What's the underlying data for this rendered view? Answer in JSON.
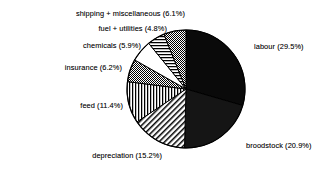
{
  "chart_data": {
    "type": "pie",
    "title": "",
    "subtitle": "",
    "xlabel": "",
    "ylabel": "",
    "legend_position": "none",
    "grid": false,
    "labels_show_percent": true,
    "start_angle_deg": 0,
    "direction": "clockwise",
    "categories": [
      "labour",
      "broodstock",
      "depreciation",
      "feed",
      "insurance",
      "chemicals",
      "fuel + utilities",
      "shipping + miscellaneous"
    ],
    "values": [
      29.5,
      20.9,
      15.2,
      11.4,
      6.2,
      5.9,
      4.8,
      6.1
    ],
    "units": "percent",
    "total": 100.0,
    "slices": [
      {
        "name": "labour",
        "value": 29.5,
        "label": "labour (29.5%)",
        "fill": "solid-black",
        "color": "#0a0a0a",
        "label_side": "right"
      },
      {
        "name": "broodstock",
        "value": 20.9,
        "label": "broodstock (20.9%)",
        "fill": "solid-near-black",
        "color": "#141414",
        "label_side": "right"
      },
      {
        "name": "depreciation",
        "value": 15.2,
        "label": "depreciation (15.2%)",
        "fill": "diagonal-hatch",
        "color": "#ffffff",
        "label_side": "left"
      },
      {
        "name": "feed",
        "value": 11.4,
        "label": "feed (11.4%)",
        "fill": "vertical-stripes",
        "color": "#ffffff",
        "label_side": "left"
      },
      {
        "name": "insurance",
        "value": 6.2,
        "label": "insurance (6.2%)",
        "fill": "gray-dither",
        "color": "#8a8a8a",
        "label_side": "left"
      },
      {
        "name": "chemicals",
        "value": 5.9,
        "label": "chemicals (5.9%)",
        "fill": "white",
        "color": "#ffffff",
        "label_side": "left"
      },
      {
        "name": "fuel + utilities",
        "value": 4.8,
        "label": "fuel + utilities (4.8%)",
        "fill": "horizontal-hatch",
        "color": "#ffffff",
        "label_side": "left"
      },
      {
        "name": "shipping + miscellaneous",
        "value": 6.1,
        "label": "shipping + miscellaneous (6.1%)",
        "fill": "gray-dither",
        "color": "#8a8a8a",
        "label_side": "left"
      }
    ],
    "geometry": {
      "center_x": 186,
      "center_y": 89,
      "radius": 59
    },
    "palette": {
      "background": "#ffffff",
      "outline": "#000000",
      "text": "#181818",
      "gray_fill": "#8a8a8a"
    }
  }
}
